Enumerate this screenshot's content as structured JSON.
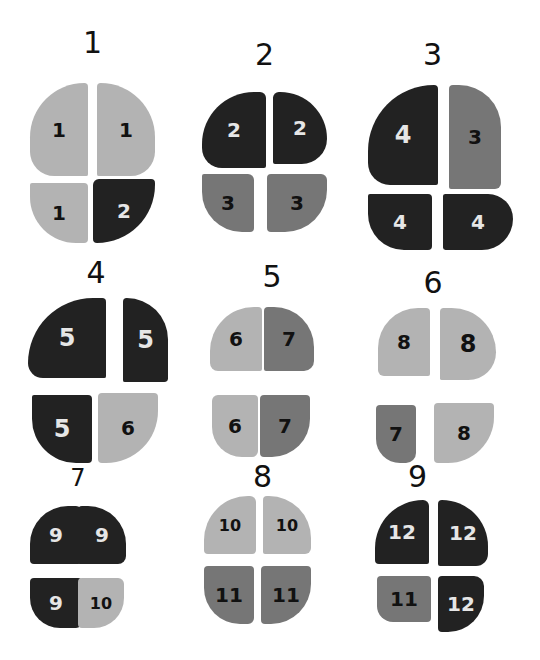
{
  "colors": {
    "light": "#b3b3b3",
    "mid": "#767676",
    "dark": "#222222",
    "text_on_dark": "#e6e6e6",
    "text_on_light": "#111111"
  },
  "figures": [
    {
      "label": "1",
      "quadrants": [
        {
          "pos": "top-left",
          "value": "1",
          "shade": "light"
        },
        {
          "pos": "top-right",
          "value": "1",
          "shade": "light"
        },
        {
          "pos": "bottom-left",
          "value": "1",
          "shade": "light"
        },
        {
          "pos": "bottom-right",
          "value": "2",
          "shade": "dark"
        }
      ]
    },
    {
      "label": "2",
      "quadrants": [
        {
          "pos": "top-left",
          "value": "2",
          "shade": "dark"
        },
        {
          "pos": "top-right",
          "value": "2",
          "shade": "dark"
        },
        {
          "pos": "bottom-left",
          "value": "3",
          "shade": "mid"
        },
        {
          "pos": "bottom-right",
          "value": "3",
          "shade": "mid"
        }
      ]
    },
    {
      "label": "3",
      "quadrants": [
        {
          "pos": "top-left",
          "value": "4",
          "shade": "dark"
        },
        {
          "pos": "top-right",
          "value": "3",
          "shade": "mid"
        },
        {
          "pos": "bottom-left",
          "value": "4",
          "shade": "dark"
        },
        {
          "pos": "bottom-right",
          "value": "4",
          "shade": "dark"
        }
      ]
    },
    {
      "label": "4",
      "quadrants": [
        {
          "pos": "top-left",
          "value": "5",
          "shade": "dark"
        },
        {
          "pos": "top-right",
          "value": "5",
          "shade": "dark"
        },
        {
          "pos": "bottom-left",
          "value": "5",
          "shade": "dark"
        },
        {
          "pos": "bottom-right",
          "value": "6",
          "shade": "light"
        }
      ]
    },
    {
      "label": "5",
      "quadrants": [
        {
          "pos": "top-left",
          "value": "6",
          "shade": "light"
        },
        {
          "pos": "top-right",
          "value": "7",
          "shade": "mid"
        },
        {
          "pos": "bottom-left",
          "value": "6",
          "shade": "light"
        },
        {
          "pos": "bottom-right",
          "value": "7",
          "shade": "mid"
        }
      ]
    },
    {
      "label": "6",
      "quadrants": [
        {
          "pos": "top-left",
          "value": "8",
          "shade": "light"
        },
        {
          "pos": "top-right",
          "value": "8",
          "shade": "light"
        },
        {
          "pos": "bottom-left",
          "value": "7",
          "shade": "mid"
        },
        {
          "pos": "bottom-right",
          "value": "8",
          "shade": "light"
        }
      ]
    },
    {
      "label": "7",
      "quadrants": [
        {
          "pos": "top-left",
          "value": "9",
          "shade": "dark"
        },
        {
          "pos": "top-right",
          "value": "9",
          "shade": "dark"
        },
        {
          "pos": "bottom-left",
          "value": "9",
          "shade": "dark"
        },
        {
          "pos": "bottom-right",
          "value": "10",
          "shade": "light"
        }
      ]
    },
    {
      "label": "8",
      "quadrants": [
        {
          "pos": "top-left",
          "value": "10",
          "shade": "light"
        },
        {
          "pos": "top-right",
          "value": "10",
          "shade": "light"
        },
        {
          "pos": "bottom-left",
          "value": "11",
          "shade": "mid"
        },
        {
          "pos": "bottom-right",
          "value": "11",
          "shade": "mid"
        }
      ]
    },
    {
      "label": "9",
      "quadrants": [
        {
          "pos": "top-left",
          "value": "12",
          "shade": "dark"
        },
        {
          "pos": "top-right",
          "value": "12",
          "shade": "dark"
        },
        {
          "pos": "bottom-left",
          "value": "11",
          "shade": "mid"
        },
        {
          "pos": "bottom-right",
          "value": "12",
          "shade": "dark"
        }
      ]
    }
  ]
}
